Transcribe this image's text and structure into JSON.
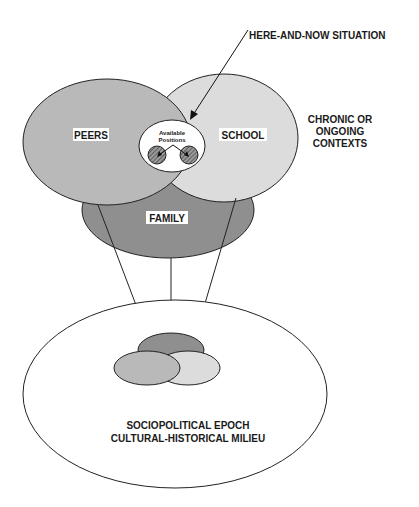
{
  "diagram": {
    "callout_label": "HERE-AND-NOW SITUATION",
    "context_label_lines": [
      "CHRONIC OR",
      "ONGOING",
      "CONTEXTS"
    ],
    "circles": {
      "peers": {
        "label": "PEERS",
        "fill": "#b9b9b9"
      },
      "school": {
        "label": "SCHOOL",
        "fill": "#dcdcdc"
      },
      "family": {
        "label": "FAMILY",
        "fill": "#8f8f8f"
      }
    },
    "positions_label_lines": [
      "Available",
      "Positions"
    ],
    "epoch_label_lines": [
      "SOCIOPOLITICAL EPOCH",
      "CULTURAL-HISTORICAL MILIEU"
    ]
  }
}
